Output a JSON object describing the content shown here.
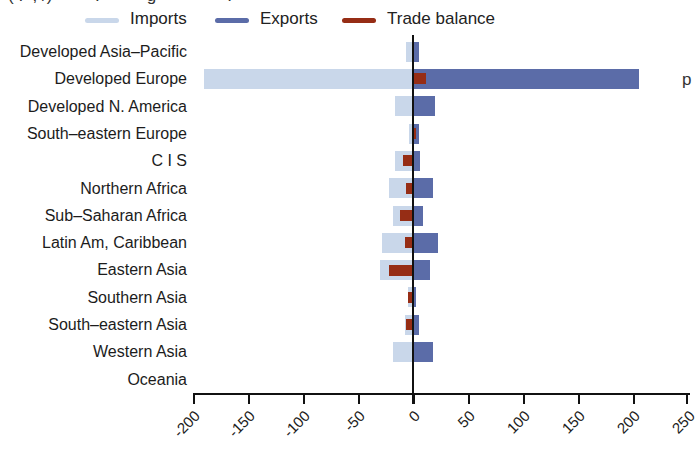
{
  "top_cropped_text": "( .  , /)         .          g               .",
  "right_cropped_text": "p",
  "colors": {
    "imports": "#c9d7ea",
    "exports": "#5b6ca8",
    "trade_balance": "#962d15",
    "axis": "#111111",
    "text": "#1c1c1c"
  },
  "chart_data": {
    "type": "bar",
    "orientation": "horizontal",
    "title": "",
    "xlabel": "",
    "ylabel": "",
    "xlim": [
      -200,
      250
    ],
    "grid": false,
    "legend_position": "top",
    "categories": [
      "Developed Asia–Pacific",
      "Developed Europe",
      "Developed N. America",
      "South–eastern Europe",
      "C I S",
      "Northern Africa",
      "Sub–Saharan Africa",
      "Latin Am, Caribbean",
      "Eastern Asia",
      "Southern Asia",
      "South–eastern Asia",
      "Western Asia",
      "Oceania"
    ],
    "series": [
      {
        "name": "Imports",
        "color": "#c9d7ea",
        "values": [
          -6,
          -190,
          -16,
          -4,
          -16,
          -22,
          -18,
          -28,
          -30,
          -5,
          -7,
          -18,
          0
        ]
      },
      {
        "name": "Exports",
        "color": "#5b6ca8",
        "values": [
          5,
          205,
          20,
          5,
          6,
          18,
          9,
          23,
          15,
          3,
          5,
          18,
          0
        ]
      },
      {
        "name": "Trade balance",
        "color": "#962d15",
        "values": [
          -1,
          12,
          0,
          3,
          -9,
          -6,
          -12,
          -7,
          -22,
          -5,
          -6,
          0,
          0
        ]
      }
    ],
    "x_ticks": [
      "-200",
      "-150",
      "-100",
      "-50",
      "0",
      "50",
      "100",
      "150",
      "200",
      "250"
    ]
  }
}
